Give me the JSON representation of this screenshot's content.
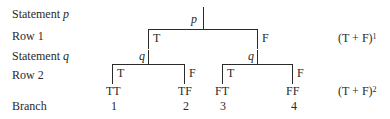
{
  "labels": {
    "statement_p": "Statement",
    "statement_p_var": "p",
    "row1": "Row 1",
    "statement_q": "Statement",
    "statement_q_var": "q",
    "row2": "Row 2",
    "branch": "Branch"
  },
  "tree": {
    "root_var": "p",
    "row1": {
      "left": "T",
      "right": "F"
    },
    "q_left": "q",
    "q_right": "q",
    "row2": {
      "ll": "T",
      "lr": "F",
      "rl": "T",
      "rr": "F"
    },
    "leaves": [
      "TT",
      "TF",
      "FT",
      "FF"
    ],
    "branch_numbers": [
      "1",
      "2",
      "3",
      "4"
    ]
  },
  "formulas": {
    "row1_base": "(T + F)",
    "row1_exp": "1",
    "row2_base": "(T + F)",
    "row2_exp": "2"
  }
}
